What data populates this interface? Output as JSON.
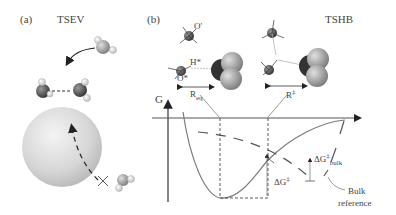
{
  "panel_a": {
    "label": "(a)",
    "title": "TSEV"
  },
  "panel_b": {
    "label": "(b)",
    "title": "TSHB",
    "atom_labels": {
      "o_prime": "O'",
      "h_star": "H*",
      "o_star": "O*"
    },
    "distance_labels": {
      "r_eq": "R",
      "r_eq_sub": "eq",
      "r_ts": "R",
      "r_ts_sup": "‡"
    },
    "axis_label": "G",
    "delta_g_ts": "ΔG",
    "delta_g_ts_sup": "‡",
    "delta_g_bulk": "ΔG",
    "delta_g_bulk_sup": "‡",
    "delta_g_bulk_sub": "bulk",
    "bulk_reference_line1": "Bulk",
    "bulk_reference_line2": "reference"
  },
  "colors": {
    "curve": "#7a7a7a",
    "axis": "#555555",
    "sphere": "#d9d9d9",
    "oxygen": "#555555",
    "hydrogen": "#eeeeee"
  }
}
